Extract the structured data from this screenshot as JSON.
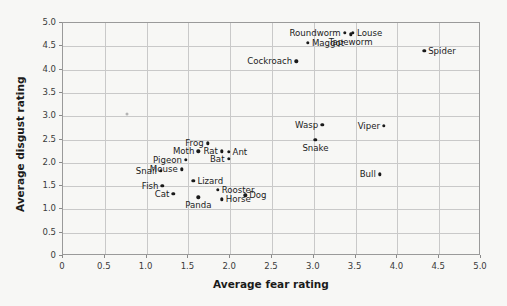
{
  "chart_data": {
    "type": "scatter",
    "title": "",
    "xlabel": "Average fear rating",
    "ylabel": "Average disgust rating",
    "xlim": [
      0,
      5.0
    ],
    "ylim": [
      0,
      5.0
    ],
    "grid": true,
    "legend": "none",
    "xticks": [
      "0",
      "0.5",
      "1.0",
      "1.5",
      "2.0",
      "2.5",
      "3.0",
      "3.5",
      "4.0",
      "4.5",
      "5.0"
    ],
    "yticks": [
      "0",
      "0.5",
      "1.0",
      "1.5",
      "2.0",
      "2.5",
      "3.0",
      "3.5",
      "4.0",
      "4.5",
      "5.0"
    ],
    "xtick_values": [
      0,
      0.5,
      1.0,
      1.5,
      2.0,
      2.5,
      3.0,
      3.5,
      4.0,
      4.5,
      5.0
    ],
    "ytick_values": [
      0,
      0.5,
      1.0,
      1.5,
      2.0,
      2.5,
      3.0,
      3.5,
      4.0,
      4.5,
      5.0
    ],
    "points": [
      {
        "label": "Roundworm",
        "x": 3.37,
        "y": 4.79,
        "label_pos": "left"
      },
      {
        "label": "Louse",
        "x": 3.47,
        "y": 4.79,
        "label_pos": "right"
      },
      {
        "label": "Tapeworm",
        "x": 3.44,
        "y": 4.76,
        "label_pos": "below"
      },
      {
        "label": "Maggot",
        "x": 2.93,
        "y": 4.57,
        "label_pos": "right"
      },
      {
        "label": "Spider",
        "x": 4.32,
        "y": 4.4,
        "label_pos": "right"
      },
      {
        "label": "Cockroach",
        "x": 2.79,
        "y": 4.18,
        "label_pos": "left"
      },
      {
        "label": "Wasp",
        "x": 3.1,
        "y": 2.82,
        "label_pos": "left"
      },
      {
        "label": "Viper",
        "x": 3.84,
        "y": 2.8,
        "label_pos": "left"
      },
      {
        "label": "Snake",
        "x": 3.02,
        "y": 2.5,
        "label_pos": "below"
      },
      {
        "label": "Frog",
        "x": 1.73,
        "y": 2.42,
        "label_pos": "left"
      },
      {
        "label": "Moth",
        "x": 1.62,
        "y": 2.25,
        "label_pos": "left"
      },
      {
        "label": "Rat",
        "x": 1.9,
        "y": 2.25,
        "label_pos": "left"
      },
      {
        "label": "Ant",
        "x": 1.98,
        "y": 2.23,
        "label_pos": "right"
      },
      {
        "label": "Bat",
        "x": 1.98,
        "y": 2.08,
        "label_pos": "left"
      },
      {
        "label": "Pigeon",
        "x": 1.47,
        "y": 2.07,
        "label_pos": "left"
      },
      {
        "label": "Mouse",
        "x": 1.42,
        "y": 1.86,
        "label_pos": "left"
      },
      {
        "label": "Snail",
        "x": 1.17,
        "y": 1.83,
        "label_pos": "left"
      },
      {
        "label": "Bull",
        "x": 3.79,
        "y": 1.75,
        "label_pos": "left"
      },
      {
        "label": "Lizard",
        "x": 1.56,
        "y": 1.62,
        "label_pos": "right"
      },
      {
        "label": "Fish",
        "x": 1.19,
        "y": 1.5,
        "label_pos": "left"
      },
      {
        "label": "Rooster",
        "x": 1.85,
        "y": 1.42,
        "label_pos": "right"
      },
      {
        "label": "Cat",
        "x": 1.32,
        "y": 1.33,
        "label_pos": "left"
      },
      {
        "label": "Dog",
        "x": 2.18,
        "y": 1.3,
        "label_pos": "right"
      },
      {
        "label": "Horse",
        "x": 1.9,
        "y": 1.22,
        "label_pos": "right"
      },
      {
        "label": "Panda",
        "x": 1.62,
        "y": 1.26,
        "label_pos": "below"
      },
      {
        "label": "",
        "x": 0.77,
        "y": 3.05,
        "label_pos": "none",
        "faint": true
      }
    ]
  }
}
